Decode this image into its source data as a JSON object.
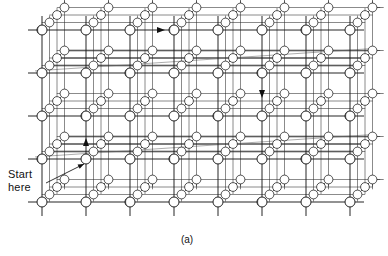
{
  "figure": {
    "kind": "3d-cubic-lattice-diagram",
    "caption": "(a)",
    "annotations": [
      {
        "id": "start-here",
        "line1": "Start",
        "line2": "here"
      }
    ],
    "colors": {
      "ink": "#111111",
      "line": "#1a1a1a",
      "node_fill": "#ffffff",
      "background": "#ffffff",
      "shade": "#8a8a8a"
    },
    "lattice": {
      "columns": 8,
      "rows": 5,
      "depth_layers": 4,
      "front_x": [
        42,
        86,
        130,
        174,
        218,
        262,
        306,
        350
      ],
      "front_y": [
        30,
        73,
        116,
        159,
        202
      ],
      "depth_step_x": 7.5,
      "depth_step_y": -7.5,
      "node_radius": 5.0,
      "stub_length": 14
    },
    "arrows": [
      {
        "id": "arrow-right-top",
        "direction": "right",
        "x": 163,
        "y": 30
      },
      {
        "id": "arrow-down-right",
        "direction": "down",
        "x": 262,
        "y": 96
      },
      {
        "id": "arrow-up-center-left",
        "direction": "up",
        "x": 86,
        "y": 140
      }
    ],
    "leader": {
      "id": "start-here-leader",
      "from_x": 46,
      "from_y": 183,
      "to_x": 84,
      "to_y": 164
    }
  }
}
